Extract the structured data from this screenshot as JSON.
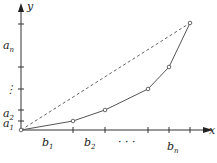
{
  "diagram": {
    "axes": {
      "x_label": "x",
      "y_label": "y"
    },
    "y_labels": [
      {
        "main": "a",
        "sub": "n",
        "y": 48
      },
      {
        "main": "⋮",
        "sub": "",
        "y": 87
      },
      {
        "main": "a",
        "sub": "2",
        "y": 115
      },
      {
        "main": "a",
        "sub": "1",
        "y": 126
      }
    ],
    "x_labels": [
      {
        "main": "b",
        "sub": "1",
        "x": 42
      },
      {
        "main": "b",
        "sub": "2",
        "x": 85
      },
      {
        "main": "· · ·",
        "sub": "",
        "x": 122
      },
      {
        "main": "b",
        "sub": "n",
        "x": 170
      }
    ],
    "polyline_points": [
      [
        21,
        130
      ],
      [
        73,
        121
      ],
      [
        105,
        110
      ],
      [
        148,
        89
      ],
      [
        169,
        67
      ],
      [
        190,
        23
      ]
    ],
    "dashed_line": [
      [
        21,
        130
      ],
      [
        190,
        23
      ]
    ],
    "colors": {
      "axis": "#333333",
      "curve": "#555555",
      "dashed": "#666666"
    }
  }
}
